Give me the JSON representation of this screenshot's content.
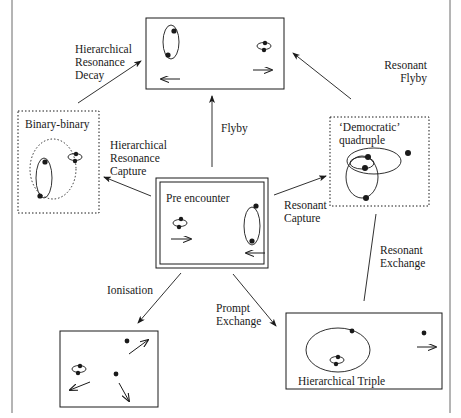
{
  "diagram": {
    "colors": {
      "ink": "#1a1a1a",
      "frame": "#6a6a6a",
      "background": "#ffffff"
    },
    "nodes": {
      "pre_encounter": {
        "label": "Pre encounter",
        "style": "double-border"
      },
      "flyby": {
        "label": "",
        "style": "solid"
      },
      "binary_binary": {
        "label": "Binary-binary",
        "style": "dotted"
      },
      "democratic_quadruple": {
        "label_line1": "‘Democratic’",
        "label_line2": "quadruple",
        "style": "dotted"
      },
      "hierarchical_triple": {
        "label": "Hierarchical Triple",
        "style": "solid"
      },
      "ionisation": {
        "label": "",
        "style": "solid"
      }
    },
    "edges": {
      "hierarchical_resonance_decay": {
        "line1": "Hierarchical",
        "line2": "Resonance",
        "line3": "Decay",
        "from": "binary_binary",
        "to": "flyby"
      },
      "resonant_flyby": {
        "line1": "Resonant",
        "line2": "Flyby",
        "from": "democratic_quadruple",
        "to": "flyby"
      },
      "flyby": {
        "line1": "Flyby",
        "from": "pre_encounter",
        "to": "flyby"
      },
      "hierarchical_resonance_capture": {
        "line1": "Hierarchical",
        "line2": "Resonance",
        "line3": "Capture",
        "from": "pre_encounter",
        "to": "binary_binary"
      },
      "resonant_capture": {
        "line1": "Resonant",
        "line2": "Capture",
        "from": "pre_encounter",
        "to": "democratic_quadruple"
      },
      "resonant_exchange": {
        "line1": "Resonant",
        "line2": "Exchange",
        "from": "democratic_quadruple",
        "to": "hierarchical_triple"
      },
      "ionisation": {
        "line1": "Ionisation",
        "from": "pre_encounter",
        "to": "ionisation"
      },
      "prompt_exchange": {
        "line1": "Prompt",
        "line2": "Exchange",
        "from": "pre_encounter",
        "to": "hierarchical_triple"
      }
    }
  }
}
